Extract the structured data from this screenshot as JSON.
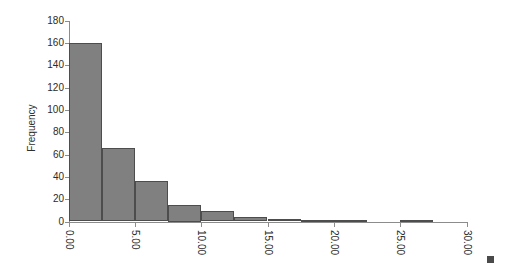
{
  "chart": {
    "type": "histogram",
    "ylabel": "Frequency",
    "xlabel": ""
  },
  "chart_data": {
    "type": "bar",
    "title": "",
    "xlabel": "",
    "ylabel": "Frequency",
    "xlim": [
      0.0,
      30.0
    ],
    "ylim": [
      0,
      180
    ],
    "grid": false,
    "legend": null,
    "bin_width": 2.5,
    "bin_edges": [
      0.0,
      2.5,
      5.0,
      7.5,
      10.0,
      12.5,
      15.0,
      17.5,
      20.0,
      22.5,
      25.0,
      27.5,
      30.0
    ],
    "categories": [
      "0.0-2.5",
      "2.5-5.0",
      "5.0-7.5",
      "7.5-10.0",
      "10.0-12.5",
      "12.5-15.0",
      "15.0-17.5",
      "17.5-20.0",
      "20.0-22.5",
      "22.5-25.0",
      "25.0-27.5",
      "27.5-30.0"
    ],
    "values": [
      160,
      66,
      36,
      15,
      9,
      4,
      2,
      1,
      1,
      0,
      1,
      0
    ],
    "xticks": [
      0.0,
      5.0,
      10.0,
      15.0,
      20.0,
      25.0,
      30.0
    ],
    "xticklabels": [
      "0.00",
      "5.00",
      "10.00",
      "15.00",
      "20.00",
      "25.00",
      "30.00"
    ],
    "yticks": [
      0,
      20,
      40,
      60,
      80,
      100,
      120,
      140,
      160,
      180
    ],
    "yticklabels": [
      "0",
      "20",
      "40",
      "60",
      "80",
      "100",
      "120",
      "140",
      "160",
      "180"
    ],
    "bar_color": "#808080",
    "bar_edge_color": "#4d4d4d",
    "axis_color": "#8c8c8c",
    "background": "#ffffff"
  }
}
